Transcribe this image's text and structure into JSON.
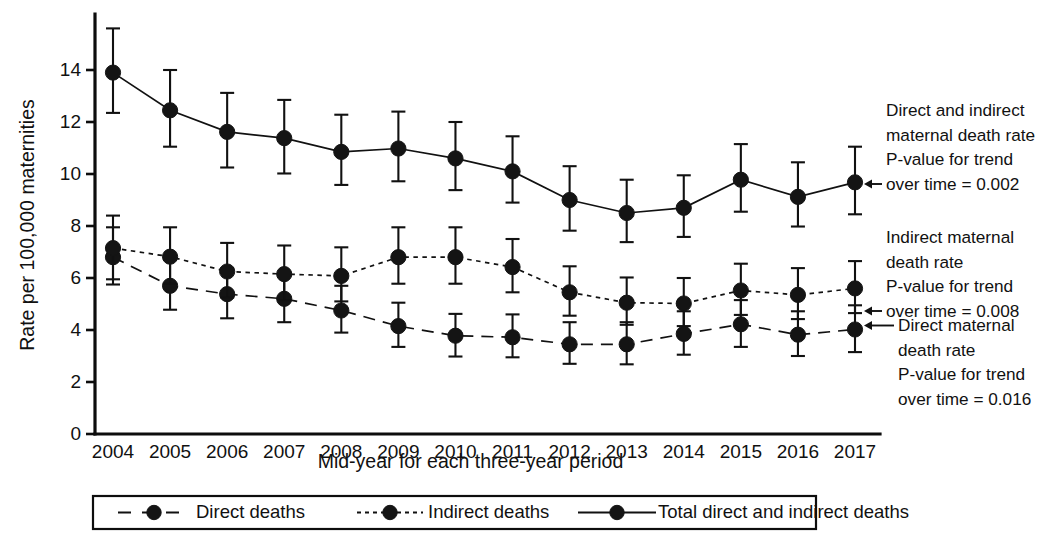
{
  "chart_data": {
    "type": "line",
    "title": "",
    "xlabel": "Mid-year for each three-year period",
    "ylabel": "Rate per 100,000 maternities",
    "categories": [
      "2004",
      "2005",
      "2006",
      "2007",
      "2008",
      "2009",
      "2010",
      "2011",
      "2012",
      "2013",
      "2014",
      "2015",
      "2016",
      "2017"
    ],
    "xtick_labels": [
      "2004",
      "2005",
      "2006",
      "2007",
      "2008",
      "2009",
      "2010",
      "2011",
      "2012",
      "2013",
      "2014",
      "2015",
      "2016",
      "2017"
    ],
    "ytick_labels": [
      "0",
      "2",
      "4",
      "6",
      "8",
      "10",
      "12",
      "14"
    ],
    "ytick_values": [
      0,
      2,
      4,
      6,
      8,
      10,
      12,
      14
    ],
    "ylim": [
      0,
      15.9
    ],
    "grid": false,
    "legend_position": "bottom",
    "series": [
      {
        "name": "Direct deaths",
        "line_style": "long-dash",
        "values": [
          6.8,
          5.7,
          5.38,
          5.2,
          4.75,
          4.15,
          3.78,
          3.72,
          3.45,
          3.45,
          3.85,
          4.22,
          3.82,
          4.02
        ],
        "ci_lower": [
          5.75,
          4.78,
          4.45,
          4.3,
          3.9,
          3.35,
          2.98,
          2.95,
          2.7,
          2.68,
          3.05,
          3.35,
          3.0,
          3.15
        ],
        "ci_upper": [
          7.95,
          6.7,
          6.38,
          6.2,
          5.7,
          5.05,
          4.62,
          4.6,
          4.3,
          4.3,
          4.72,
          5.15,
          4.72,
          4.95
        ]
      },
      {
        "name": "Indirect deaths",
        "line_style": "short-dash",
        "values": [
          7.15,
          6.82,
          6.25,
          6.15,
          6.08,
          6.8,
          6.8,
          6.42,
          5.45,
          5.05,
          5.02,
          5.52,
          5.35,
          5.6
        ],
        "ci_lower": [
          5.95,
          5.78,
          5.25,
          5.15,
          5.1,
          5.78,
          5.78,
          5.45,
          4.55,
          4.2,
          4.15,
          4.58,
          4.42,
          4.65
        ],
        "ci_upper": [
          8.4,
          7.95,
          7.35,
          7.25,
          7.18,
          7.95,
          7.95,
          7.5,
          6.45,
          6.02,
          6.0,
          6.55,
          6.38,
          6.65
        ]
      },
      {
        "name": "Total direct and indirect deaths",
        "line_style": "solid",
        "values": [
          13.9,
          12.45,
          11.62,
          11.38,
          10.85,
          10.98,
          10.6,
          10.1,
          9.0,
          8.5,
          8.7,
          9.78,
          9.12,
          9.68
        ],
        "ci_lower": [
          12.35,
          11.05,
          10.25,
          10.02,
          9.58,
          9.72,
          9.38,
          8.9,
          7.82,
          7.38,
          7.58,
          8.55,
          7.98,
          8.45
        ],
        "ci_upper": [
          15.6,
          14.0,
          13.12,
          12.85,
          12.28,
          12.4,
          12.0,
          11.45,
          10.3,
          9.78,
          9.95,
          11.15,
          10.45,
          11.05
        ]
      }
    ],
    "annotations": [
      {
        "id": "total-annotation",
        "target_series": "Total direct and indirect deaths",
        "lines": [
          "Direct and indirect",
          "maternal death rate",
          "P-value for trend",
          "over time = 0.002"
        ],
        "p_value": "0.002"
      },
      {
        "id": "indirect-annotation",
        "target_series": "Indirect deaths",
        "lines": [
          "Indirect maternal",
          "death rate",
          "P-value for trend",
          "over time = 0.008"
        ],
        "p_value": "0.008"
      },
      {
        "id": "direct-annotation",
        "target_series": "Direct deaths",
        "lines": [
          "Direct maternal",
          "death rate",
          "P-value for trend",
          "over time = 0.016"
        ],
        "p_value": "0.016"
      }
    ],
    "legend": [
      {
        "label": "Direct deaths",
        "line_style": "long-dash"
      },
      {
        "label": "Indirect deaths",
        "line_style": "short-dash"
      },
      {
        "label": "Total direct and indirect deaths",
        "line_style": "solid"
      }
    ],
    "colors": {
      "ink": "#111111",
      "background": "#ffffff"
    }
  }
}
